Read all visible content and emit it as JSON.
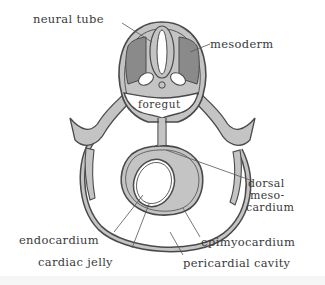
{
  "diagram": {
    "labels": {
      "neural_tube": "neural tube",
      "mesoderm": "mesoderm",
      "foregut": "foregut",
      "dorsal_mesocardium_line1": "dorsal",
      "dorsal_mesocardium_line2": "meso-",
      "dorsal_mesocardium_line3": "cardium",
      "endocardium": "endocardium",
      "cardiac_jelly": "cardiac jelly",
      "epimyocardium": "epimyocardium",
      "pericardial_cavity": "pericardial cavity"
    },
    "colors": {
      "tissue_fill": "#c4c4c4",
      "mesoderm_fill": "#8a8a8a",
      "outline": "#4a4a4a",
      "cavity_fill": "#ffffff",
      "label_text": "#3a3a3a",
      "leader_line": "#555555"
    }
  }
}
